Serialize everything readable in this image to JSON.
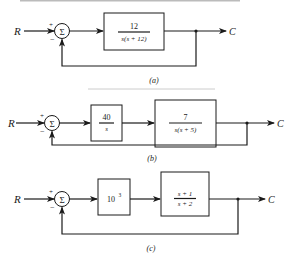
{
  "diagrams": [
    {
      "id": "a",
      "label": "(a)",
      "input": "R",
      "output": "C",
      "summer": {
        "symbol": "Σ",
        "plus": "+",
        "minus": "−"
      },
      "blocks": [
        {
          "num": "12",
          "den": "s(s + 12)"
        }
      ]
    },
    {
      "id": "b",
      "label": "(b)",
      "input": "R",
      "output": "C",
      "summer": {
        "symbol": "Σ",
        "plus": "+",
        "minus": "−"
      },
      "blocks": [
        {
          "num": "40",
          "den": "s"
        },
        {
          "num": "7",
          "den": "s(s + 5)"
        }
      ]
    },
    {
      "id": "c",
      "label": "(c)",
      "input": "R",
      "output": "C",
      "summer": {
        "symbol": "Σ",
        "plus": "+",
        "minus": "−"
      },
      "blocks": [
        {
          "gain": "10",
          "exp": "3"
        },
        {
          "num": "s + 1",
          "den": "s + 2"
        }
      ]
    }
  ]
}
